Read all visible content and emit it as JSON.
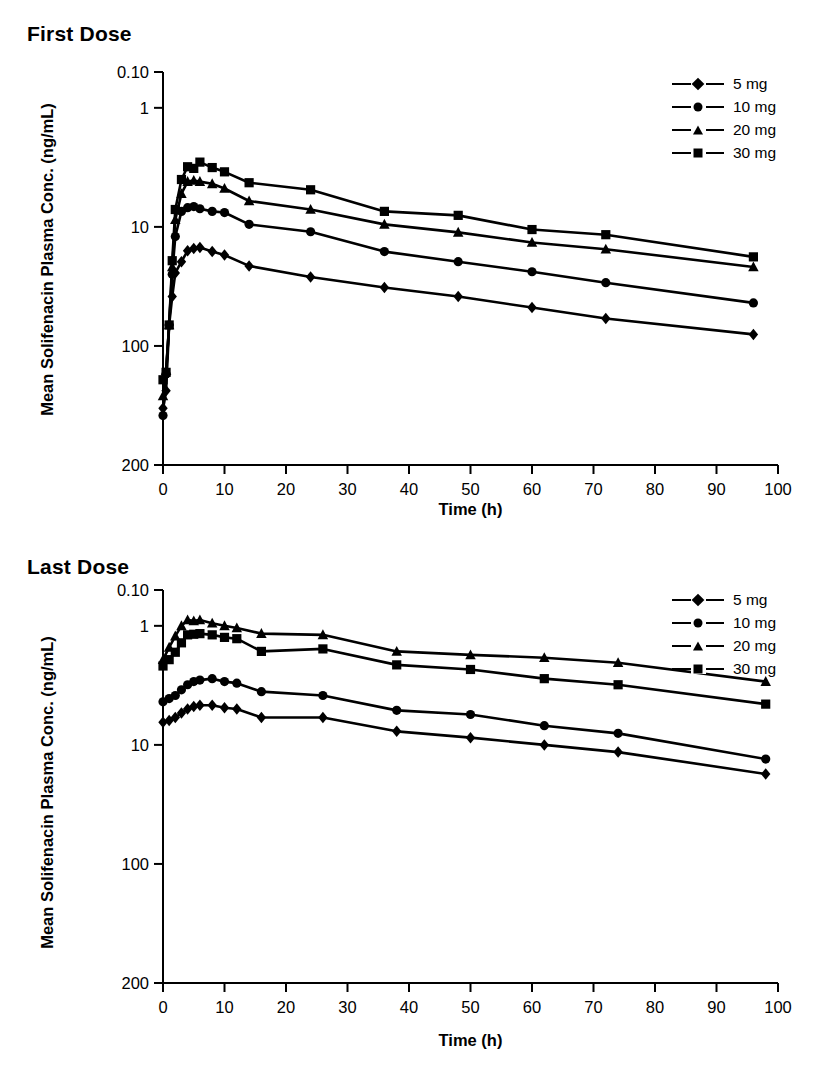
{
  "figure": {
    "yaxis_label": "Mean Solifenacin Plasma Conc. (ng/mL)",
    "xaxis_label": "Time (h)",
    "scale": "log",
    "ytick_labels": [
      "200",
      "100",
      "10",
      "1",
      "0.10"
    ],
    "xtick_labels": [
      "0",
      "10",
      "20",
      "30",
      "40",
      "50",
      "60",
      "70",
      "80",
      "90",
      "100"
    ],
    "legend": [
      {
        "label": "5 mg",
        "marker": "diamond-marker"
      },
      {
        "label": "10 mg",
        "marker": "circle-marker"
      },
      {
        "label": "20 mg",
        "marker": "triangle-marker"
      },
      {
        "label": "30 mg",
        "marker": "square-marker"
      }
    ]
  },
  "chart_data": [
    {
      "type": "line",
      "title": "First Dose",
      "xlabel": "Time (h)",
      "ylabel": "Mean Solifenacin Plasma Conc. (ng/mL)",
      "yscale": "log",
      "ylim": [
        0.1,
        200
      ],
      "xlim": [
        0,
        100
      ],
      "yticks": [
        0.1,
        1,
        10,
        100,
        200
      ],
      "xticks": [
        0,
        10,
        20,
        30,
        40,
        50,
        60,
        70,
        80,
        90,
        100
      ],
      "grid": false,
      "legend_position": "top-right",
      "series": [
        {
          "name": "5 mg",
          "marker": "diamond",
          "x": [
            0,
            0.5,
            1,
            1.5,
            2,
            3,
            4,
            5,
            6,
            8,
            10,
            14,
            24,
            36,
            48,
            60,
            72,
            96
          ],
          "y": [
            0.3,
            0.42,
            1.5,
            2.6,
            4.1,
            5.1,
            6.3,
            6.6,
            6.7,
            6.2,
            5.8,
            4.7,
            3.8,
            3.1,
            2.6,
            2.1,
            1.7,
            1.25
          ]
        },
        {
          "name": "10 mg",
          "marker": "circle",
          "x": [
            0,
            0.5,
            1,
            1.5,
            2,
            3,
            4,
            5,
            6,
            8,
            10,
            14,
            24,
            36,
            48,
            60,
            72,
            96
          ],
          "y": [
            0.26,
            0.58,
            1.5,
            4.0,
            8.3,
            13.5,
            14.5,
            14.8,
            14.2,
            13.5,
            13.2,
            10.5,
            9.1,
            6.2,
            5.1,
            4.2,
            3.4,
            2.3
          ]
        },
        {
          "name": "20 mg",
          "marker": "triangle",
          "x": [
            0,
            0.5,
            1,
            1.5,
            2,
            3,
            4,
            5,
            6,
            8,
            10,
            14,
            24,
            36,
            48,
            60,
            72,
            96
          ],
          "y": [
            0.38,
            0.62,
            1.5,
            4.6,
            11.5,
            19.0,
            24.0,
            24.5,
            24.0,
            23.0,
            21.0,
            16.5,
            14.0,
            10.5,
            9.0,
            7.4,
            6.5,
            4.6
          ]
        },
        {
          "name": "30 mg",
          "marker": "square",
          "x": [
            0,
            0.5,
            1,
            1.5,
            2,
            3,
            4,
            5,
            6,
            8,
            10,
            14,
            24,
            36,
            48,
            60,
            72,
            96
          ],
          "y": [
            0.52,
            0.6,
            1.5,
            5.2,
            14.0,
            25.0,
            32.0,
            31.0,
            35.0,
            31.5,
            29.0,
            23.5,
            20.5,
            13.5,
            12.5,
            9.5,
            8.6,
            5.6
          ]
        }
      ]
    },
    {
      "type": "line",
      "title": "Last Dose",
      "xlabel": "Time (h)",
      "ylabel": "Mean Solifenacin Plasma Conc. (ng/mL)",
      "yscale": "log",
      "ylim": [
        0.1,
        200
      ],
      "xlim": [
        0,
        100
      ],
      "yticks": [
        0.1,
        1,
        10,
        100,
        200
      ],
      "xticks": [
        0,
        10,
        20,
        30,
        40,
        50,
        60,
        70,
        80,
        90,
        100
      ],
      "grid": false,
      "legend_position": "top-right",
      "series": [
        {
          "name": "5 mg",
          "marker": "diamond",
          "x": [
            0,
            1,
            2,
            3,
            4,
            5,
            6,
            8,
            10,
            12,
            16,
            26,
            38,
            50,
            62,
            74,
            98
          ],
          "y": [
            15.5,
            16.0,
            17.0,
            18.5,
            20.0,
            21.0,
            21.5,
            21.5,
            20.5,
            20.0,
            17.0,
            17.0,
            13.0,
            11.5,
            10.0,
            8.7,
            5.7
          ]
        },
        {
          "name": "10 mg",
          "marker": "circle",
          "x": [
            0,
            1,
            2,
            3,
            4,
            5,
            6,
            8,
            10,
            12,
            16,
            26,
            38,
            50,
            62,
            74,
            98
          ],
          "y": [
            23.0,
            24.5,
            26.0,
            29.0,
            32.0,
            34.0,
            35.0,
            36.0,
            34.0,
            33.0,
            28.0,
            26.0,
            19.5,
            18.0,
            14.5,
            12.5,
            7.6
          ]
        },
        {
          "name": "20 mg",
          "marker": "triangle",
          "x": [
            0,
            1,
            2,
            3,
            4,
            5,
            6,
            8,
            10,
            12,
            16,
            26,
            38,
            50,
            62,
            74,
            98
          ],
          "y": [
            52.0,
            66.0,
            82.0,
            100.0,
            112.0,
            110.0,
            112.0,
            105.0,
            100.0,
            96.0,
            86.0,
            84.0,
            61.0,
            57.0,
            54.0,
            49.0,
            34.0
          ]
        },
        {
          "name": "30 mg",
          "marker": "square",
          "x": [
            0,
            1,
            2,
            3,
            4,
            5,
            6,
            8,
            10,
            12,
            16,
            26,
            38,
            50,
            62,
            74,
            98
          ],
          "y": [
            46.0,
            52.0,
            60.0,
            72.0,
            84.0,
            85.0,
            86.0,
            84.0,
            80.0,
            78.0,
            61.0,
            64.0,
            47.0,
            43.0,
            36.0,
            32.0,
            22.0
          ]
        }
      ]
    }
  ]
}
